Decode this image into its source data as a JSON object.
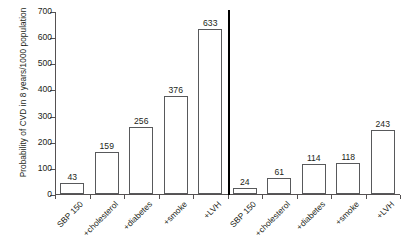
{
  "chart_data": {
    "type": "bar",
    "title": "",
    "xlabel": "",
    "ylabel": "Probability of CVD in 8 years/1000 population",
    "ylim": [
      0,
      700
    ],
    "ytick_labels": [
      "700",
      "600",
      "500",
      "400",
      "300",
      "200",
      "100",
      "0"
    ],
    "yticks": [
      700,
      600,
      500,
      400,
      300,
      200,
      100,
      0
    ],
    "grid": false,
    "legend": "none",
    "categories": [
      "SBP 150",
      "+cholesterol",
      "+diabetes",
      "+smoke",
      "+LVH",
      "SBP 150",
      "+cholesterol",
      "+diabetes",
      "+smoke",
      "+LVH"
    ],
    "values": [
      43,
      159,
      256,
      376,
      633,
      24,
      61,
      114,
      118,
      243
    ],
    "value_labels": [
      "43",
      "159",
      "256",
      "376",
      "633",
      "24",
      "61",
      "114",
      "118",
      "243"
    ],
    "groups": [
      {
        "name": "left-panel",
        "categories": [
          "SBP 150",
          "+cholesterol",
          "+diabetes",
          "+smoke",
          "+LVH"
        ],
        "values": [
          43,
          159,
          256,
          376,
          633
        ]
      },
      {
        "name": "right-panel",
        "categories": [
          "SBP 150",
          "+cholesterol",
          "+diabetes",
          "+smoke",
          "+LVH"
        ],
        "values": [
          24,
          61,
          114,
          118,
          243
        ]
      }
    ],
    "divider_after_index": 4,
    "bar_style": {
      "fill": "#ffffff",
      "edge": "#58595b"
    },
    "axis_color": "#555152",
    "text_color": "#231f20",
    "background": "#ffffff"
  }
}
